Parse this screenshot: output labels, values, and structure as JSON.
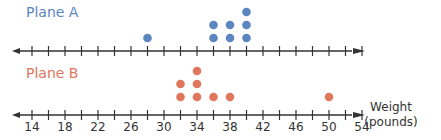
{
  "chart_data": {
    "type": "dot_plot",
    "title": "",
    "xlabel": "Weight (pounds)",
    "xlabel_lines": [
      "Weight",
      "(pounds)"
    ],
    "xlim": [
      14,
      54
    ],
    "tick_step": 2,
    "tick_labels": [
      "14",
      "18",
      "22",
      "26",
      "30",
      "34",
      "38",
      "42",
      "46",
      "50",
      "54"
    ],
    "tick_label_values": [
      14,
      18,
      22,
      26,
      30,
      34,
      38,
      42,
      46,
      50,
      54
    ],
    "grid": false,
    "series": [
      {
        "name": "Plane A",
        "color": "#5b86bf",
        "points": [
          {
            "x": 28,
            "count": 1
          },
          {
            "x": 36,
            "count": 2
          },
          {
            "x": 38,
            "count": 2
          },
          {
            "x": 40,
            "count": 3
          }
        ]
      },
      {
        "name": "Plane B",
        "color": "#e0765c",
        "points": [
          {
            "x": 32,
            "count": 2
          },
          {
            "x": 34,
            "count": 3
          },
          {
            "x": 36,
            "count": 1
          },
          {
            "x": 38,
            "count": 1
          },
          {
            "x": 50,
            "count": 1
          }
        ]
      }
    ]
  },
  "labels": {
    "plane_a": "Plane A",
    "plane_b": "Plane B",
    "weight": "Weight",
    "pounds": "(pounds)"
  },
  "colors": {
    "axis": "#333333",
    "plane_a": "#5b86bf",
    "plane_b": "#e0765c"
  }
}
